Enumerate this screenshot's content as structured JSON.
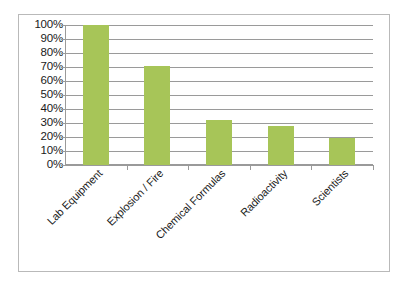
{
  "chart_data": {
    "type": "bar",
    "title": "",
    "subtitle": "",
    "xlabel": "",
    "ylabel": "",
    "categories": [
      "Lab Equipment",
      "Explosion / Fire",
      "Chemical Formulas",
      "Radioactivity",
      "Scientists"
    ],
    "values": [
      100,
      71,
      32,
      28,
      19
    ],
    "value_suffix": "%",
    "ylim": [
      0,
      100
    ],
    "ytick_values": [
      0,
      10,
      20,
      30,
      40,
      50,
      60,
      70,
      80,
      90,
      100
    ],
    "ytick_labels": [
      "0%",
      "10%",
      "20%",
      "30%",
      "40%",
      "50%",
      "60%",
      "70%",
      "80%",
      "90%",
      "100%"
    ],
    "grid": true,
    "grid_axis": "y",
    "legend": false,
    "legend_position": "none",
    "data_labels": false,
    "series": [
      {
        "name": "Share of depictions",
        "values": [
          100,
          71,
          32,
          28,
          19
        ],
        "color": "#a7c558"
      }
    ],
    "annotations": []
  },
  "style": {
    "bar_color": "#a7c558",
    "grid_color": "#9a9a9a",
    "axis_color": "#9a9a9a",
    "text_color": "#1a1a1a",
    "frame_color": "#b9b9b9",
    "background": "#ffffff",
    "label_rotation_deg": -45
  }
}
